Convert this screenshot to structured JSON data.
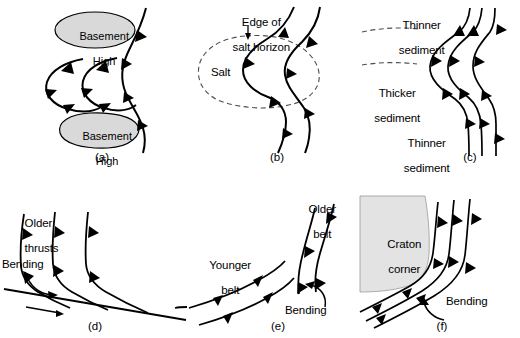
{
  "figure": {
    "type": "geological-diagram",
    "background_color": "#ffffff",
    "line_color": "#000000",
    "fill_gray": "#d9d9d9",
    "dashed_color": "#4d4d4d"
  },
  "panels": [
    {
      "id": "a",
      "caption": "(a)",
      "labels": [
        {
          "name": "basement-high-top",
          "text": "Basement\nHigh"
        },
        {
          "name": "basement-high-bottom",
          "text": "Basement\nHigh"
        }
      ]
    },
    {
      "id": "b",
      "caption": "(b)",
      "labels": [
        {
          "name": "edge-of-salt-horizon",
          "text": "Edge of\nsalt horizon"
        },
        {
          "name": "salt",
          "text": "Salt"
        }
      ]
    },
    {
      "id": "c",
      "caption": "(c)",
      "labels": [
        {
          "name": "thinner-sediment-top",
          "text": "Thinner\nsediment"
        },
        {
          "name": "thicker-sediment",
          "text": "Thicker\nsediment"
        },
        {
          "name": "thinner-sediment-bottom",
          "text": "Thinner\nsediment"
        }
      ]
    },
    {
      "id": "d",
      "caption": "(d)",
      "labels": [
        {
          "name": "older-thrusts",
          "text": "Older\nthrusts"
        },
        {
          "name": "bending",
          "text": "Bending"
        }
      ]
    },
    {
      "id": "e",
      "caption": "(e)",
      "labels": [
        {
          "name": "older-belt",
          "text": "Older\nbelt"
        },
        {
          "name": "younger-belt",
          "text": "Younger\nbelt"
        },
        {
          "name": "bending",
          "text": "Bending"
        }
      ]
    },
    {
      "id": "f",
      "caption": "(f)",
      "labels": [
        {
          "name": "craton-corner",
          "text": "Craton\ncorner"
        },
        {
          "name": "bending",
          "text": "Bending"
        }
      ]
    }
  ],
  "text": {
    "basement_high": "Basement\nHigh",
    "basement_high_line1": "Basement",
    "basement_high_line2": "High",
    "edge_of_salt_horizon_line1": "Edge of",
    "edge_of_salt_horizon_line2": "salt horizon",
    "salt": "Salt",
    "thinner_sediment_line1": "Thinner",
    "thinner_sediment_line2": "sediment",
    "thicker_sediment_line1": "Thicker",
    "thicker_sediment_line2": "sediment",
    "older_thrusts_line1": "Older",
    "older_thrusts_line2": "thrusts",
    "older_belt_line1": "Older",
    "older_belt_line2": "belt",
    "younger_belt_line1": "Younger",
    "younger_belt_line2": "belt",
    "craton_corner_line1": "Craton",
    "craton_corner_line2": "corner",
    "bending": "Bending",
    "caption_a": "(a)",
    "caption_b": "(b)",
    "caption_c": "(c)",
    "caption_d": "(d)",
    "caption_e": "(e)",
    "caption_f": "(f)"
  }
}
